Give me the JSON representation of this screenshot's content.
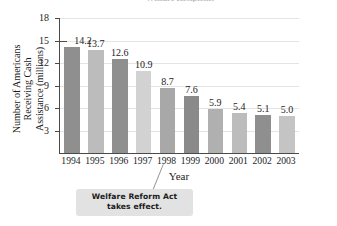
{
  "figure": {
    "partial_title": "Welfare Recipients",
    "xlabel": "Year",
    "ylabel_lines": [
      "Number of Americans",
      "Receiving Cash",
      "Assistance (millions)"
    ],
    "callout": {
      "line1": "Welfare Reform Act",
      "line2": "takes effect.",
      "points_to": "1997"
    }
  },
  "colors": {
    "bar_dark": "#8f8f8f",
    "bar_light": "#bcbcbc",
    "bar_lightest": "#d2d2d2",
    "axis": "#4a4a4a",
    "grid": "#e4e4e4",
    "callout_bg": "#e2e2e2",
    "text": "#1d1d1d"
  },
  "chart_data": {
    "type": "bar",
    "title": "Welfare Recipients",
    "xlabel": "Year",
    "ylabel": "Number of Americans Receiving Cash Assistance (millions)",
    "categories": [
      "1994",
      "1995",
      "1996",
      "1997",
      "1998",
      "1999",
      "2000",
      "2001",
      "2002",
      "2003"
    ],
    "values": [
      14.2,
      13.7,
      12.6,
      10.9,
      8.7,
      7.6,
      5.9,
      5.4,
      5.1,
      5.0
    ],
    "value_labels": [
      "14.2",
      "13.7",
      "12.6",
      "10.9",
      "8.7",
      "7.6",
      "5.9",
      "5.4",
      "5.1",
      "5.0"
    ],
    "bar_colors": [
      "#8f8f8f",
      "#bcbcbc",
      "#8f8f8f",
      "#d2d2d2",
      "#a8a8a8",
      "#8a8a8a",
      "#b0b0b0",
      "#bcbcbc",
      "#8f8f8f",
      "#c4c4c4"
    ],
    "ylim": [
      0,
      18
    ],
    "yticks": [
      3,
      6,
      9,
      12,
      15,
      18
    ],
    "ytick_labels": [
      "3",
      "6",
      "9",
      "12",
      "15",
      "18"
    ],
    "grid": "horizontal",
    "legend": "none",
    "annotations": [
      {
        "text": "Welfare Reform Act takes effect.",
        "target": "1997"
      }
    ]
  }
}
